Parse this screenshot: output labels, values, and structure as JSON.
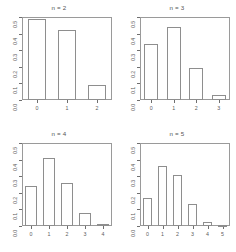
{
  "figure": {
    "layout": "2x2 grid of barplots",
    "panel_count": 4
  },
  "chart_data": [
    {
      "type": "bar",
      "title": "n = 2",
      "categories": [
        "0",
        "1",
        "2"
      ],
      "values": [
        0.49,
        0.42,
        0.09
      ],
      "xlabel": "",
      "ylabel": "",
      "ylim": [
        0.0,
        0.5
      ],
      "yticks": [
        "0.0",
        "0.1",
        "0.2",
        "0.3",
        "0.4",
        "0.5"
      ],
      "ytick_values": [
        0.0,
        0.1,
        0.2,
        0.3,
        0.4,
        0.5
      ],
      "grid": false,
      "legend": "none"
    },
    {
      "type": "bar",
      "title": "n = 3",
      "categories": [
        "0",
        "1",
        "2",
        "3"
      ],
      "values": [
        0.34,
        0.44,
        0.19,
        0.03
      ],
      "xlabel": "",
      "ylabel": "",
      "ylim": [
        0.0,
        0.5
      ],
      "yticks": [
        "0.0",
        "0.1",
        "0.2",
        "0.3",
        "0.4",
        "0.5"
      ],
      "ytick_values": [
        0.0,
        0.1,
        0.2,
        0.3,
        0.4,
        0.5
      ],
      "grid": false,
      "legend": "none"
    },
    {
      "type": "bar",
      "title": "n = 4",
      "categories": [
        "0",
        "1",
        "2",
        "3",
        "4"
      ],
      "values": [
        0.24,
        0.41,
        0.26,
        0.08,
        0.01
      ],
      "xlabel": "",
      "ylabel": "",
      "ylim": [
        0.0,
        0.5
      ],
      "yticks": [
        "0.0",
        "0.1",
        "0.2",
        "0.3",
        "0.4",
        "0.5"
      ],
      "ytick_values": [
        0.0,
        0.1,
        0.2,
        0.3,
        0.4,
        0.5
      ],
      "grid": false,
      "legend": "none"
    },
    {
      "type": "bar",
      "title": "n = 5",
      "categories": [
        "0",
        "1",
        "2",
        "3",
        "4",
        "5"
      ],
      "values": [
        0.17,
        0.36,
        0.31,
        0.13,
        0.025,
        0.002
      ],
      "xlabel": "",
      "ylabel": "",
      "ylim": [
        0.0,
        0.5
      ],
      "yticks": [
        "0.0",
        "0.1",
        "0.2",
        "0.3",
        "0.4",
        "0.5"
      ],
      "ytick_values": [
        0.0,
        0.1,
        0.2,
        0.3,
        0.4,
        0.5
      ],
      "grid": false,
      "legend": "none"
    }
  ],
  "colors": {
    "bar_border": "#8e8e8e",
    "bar_fill": "#ffffff",
    "frame": "#9a9a9a",
    "text": "#5d5d5d",
    "background": "#ffffff"
  }
}
